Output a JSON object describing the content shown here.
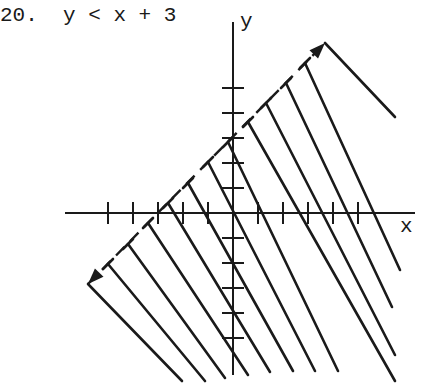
{
  "problem": {
    "number": "20.",
    "inequality": "y < x + 3",
    "text": "20.  y < x + 3"
  },
  "axes": {
    "x_label": "x",
    "y_label": "y",
    "origin_px": [
      233,
      213
    ],
    "unit_px": 25,
    "x_ticks": [
      -5,
      -4,
      -3,
      -2,
      -1,
      1,
      2,
      3,
      4,
      5
    ],
    "y_ticks": [
      -5,
      -4,
      -3,
      -2,
      -1,
      1,
      2,
      3,
      4,
      5
    ]
  },
  "boundary": {
    "equation": "y = x + 3",
    "style": "dashed",
    "from_px": [
      88,
      284
    ],
    "to_px": [
      325,
      43
    ]
  },
  "shading": {
    "region": "below line",
    "hatch_lines": [
      [
        [
          88,
          284
        ],
        [
          182,
          381
        ]
      ],
      [
        [
          108,
          264
        ],
        [
          205,
          381
        ]
      ],
      [
        [
          128,
          244
        ],
        [
          225,
          378
        ]
      ],
      [
        [
          148,
          223
        ],
        [
          248,
          375
        ]
      ],
      [
        [
          168,
          203
        ],
        [
          270,
          372
        ]
      ],
      [
        [
          188,
          183
        ],
        [
          293,
          371
        ]
      ],
      [
        [
          208,
          162
        ],
        [
          315,
          371
        ]
      ],
      [
        [
          228,
          142
        ],
        [
          338,
          371
        ]
      ],
      [
        [
          248,
          122
        ],
        [
          395,
          381
        ]
      ],
      [
        [
          266,
          103
        ],
        [
          395,
          355
        ]
      ],
      [
        [
          286,
          83
        ],
        [
          392,
          307
        ]
      ],
      [
        [
          305,
          63
        ],
        [
          400,
          270
        ]
      ],
      [
        [
          325,
          43
        ],
        [
          395,
          117
        ]
      ]
    ]
  },
  "colors": {
    "ink": "#1a1a1a",
    "background": "#ffffff"
  }
}
